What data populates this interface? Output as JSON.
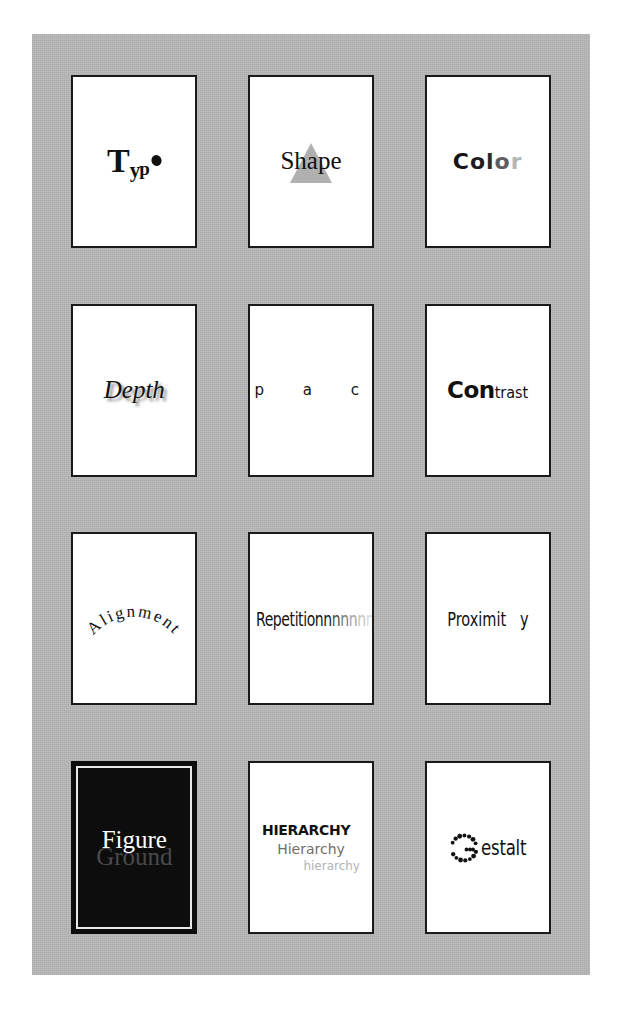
{
  "poster": {
    "title": "Design Principles",
    "background_color": "#b9b9b9",
    "card_background": "#ffffff",
    "card_border_color": "#1a1a1a",
    "columns": 3,
    "rows": 4
  },
  "cards": [
    {
      "id": "typo",
      "name": "Typography",
      "word": "Typo",
      "parts": {
        "t": "T",
        "y": "y",
        "p": "p",
        "o_dot": "o"
      },
      "style_note": "serif bold, descending scale, final o as solid dot"
    },
    {
      "id": "shape",
      "name": "Shape",
      "word": "Shape",
      "decoration": "gray triangle behind word",
      "triangle_color": "#b0b0b0"
    },
    {
      "id": "color",
      "name": "Color",
      "word": "Color",
      "letters": [
        {
          "char": "C",
          "color": "#141414"
        },
        {
          "char": "o",
          "color": "#1d1d1d"
        },
        {
          "char": "l",
          "color": "#2b2b2b"
        },
        {
          "char": "o",
          "color": "#5e5e5e"
        },
        {
          "char": "r",
          "color": "#b6b6b6"
        }
      ]
    },
    {
      "id": "depth",
      "name": "Depth",
      "word": "Depth",
      "style_note": "italic serif with drop shadow",
      "shadow_color": "#787878"
    },
    {
      "id": "space",
      "name": "Space",
      "word": "s p a c e",
      "style_note": "wide letter spacing across full card width"
    },
    {
      "id": "contrast",
      "name": "Contrast",
      "word": "Contrast",
      "heavy_part": "Con",
      "light_part": "trast"
    },
    {
      "id": "alignment",
      "name": "Alignment",
      "word": "Alignment",
      "style_note": "set on an upward arc"
    },
    {
      "id": "repetition",
      "name": "Repetition",
      "word": "Repetition",
      "repeat_tail": [
        {
          "char": "n",
          "color": "#1a1a1a"
        },
        {
          "char": "n",
          "color": "#4d4d4d"
        },
        {
          "char": "n",
          "color": "#7d7d7d"
        },
        {
          "char": "n",
          "color": "#a5a5a5"
        },
        {
          "char": "n",
          "color": "#c4c4c4"
        },
        {
          "char": "n",
          "color": "#dcdcdc"
        }
      ]
    },
    {
      "id": "proximity",
      "name": "Proximity",
      "word": "Proximity",
      "near_part": "Proximit",
      "far_part": "y",
      "style_note": "final y separated by a wide gap"
    },
    {
      "id": "figure-ground",
      "name": "Figure Ground",
      "line1": "Figure",
      "line2": "Ground",
      "background_color": "#0d0d0d",
      "line1_color": "#ffffff",
      "line2_color": "#4a4a4a"
    },
    {
      "id": "hierarchy",
      "name": "Hierarchy",
      "line1": "HIERARCHY",
      "line2": "Hierarchy",
      "line3": "hierarchy",
      "line1_color": "#111111",
      "line2_color": "#6e6e6e",
      "line3_color": "#b4b4b4"
    },
    {
      "id": "gestalt",
      "name": "Gestalt",
      "word": "Gestalt",
      "dotted_letter": "G",
      "rest": "estalt",
      "style_note": "G implied by a ring of dots (illusory contour)"
    }
  ]
}
